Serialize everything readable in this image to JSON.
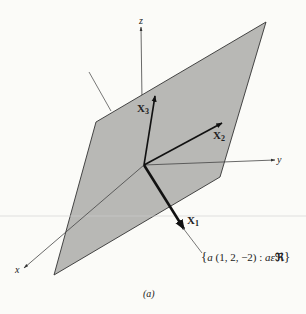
{
  "figure": {
    "caption": "(a)",
    "plane_color": "#b8b8b5",
    "edge_color": "#333333",
    "axis_color": "#555555",
    "vector_color": "#111111",
    "background": "#fbfbf8"
  },
  "axes": {
    "x_label": "x",
    "y_label": "y",
    "z_label": "z"
  },
  "vectors": {
    "x1": {
      "label": "X",
      "subscript": "1"
    },
    "x2": {
      "label": "X",
      "subscript": "2"
    },
    "x3": {
      "label": "X",
      "subscript": "3"
    }
  },
  "annotation": {
    "text_open": "{",
    "text_a": "a",
    "text_tuple": " (1, 2, −2) : ",
    "text_a2": "a",
    "text_in": "ε",
    "text_R": "ℜ",
    "text_close": "}"
  }
}
